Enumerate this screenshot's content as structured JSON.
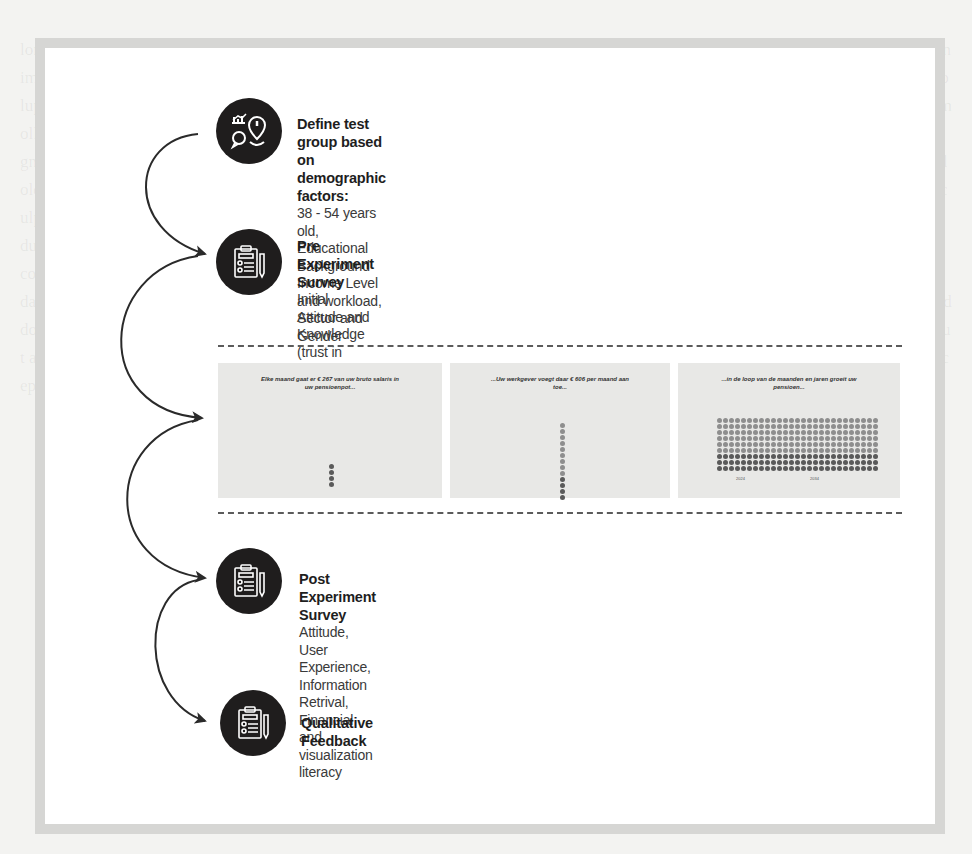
{
  "diagram": {
    "steps": [
      {
        "id": "define-test-group",
        "icon": "analytics-location-icon",
        "title": "Define test group based on demographic factors:",
        "description_lines": [
          "38 - 54 years old, Educational Background",
          "Income Level and workload, Sector and Gender"
        ]
      },
      {
        "id": "pre-experiment-survey",
        "icon": "clipboard-survey-icon",
        "title": "Pre Experiment  Survey",
        "description_lines": [
          "Initial Attitude  and Knowledge (trust in information,",
          "in fund, initial knowledge, domein specific knowledg)"
        ]
      },
      {
        "id": "post-experiment-survey",
        "icon": "clipboard-survey-icon",
        "title": "Post Experiment Survey",
        "description_lines": [
          "Attitude,  User Experience,  Information Retrival,",
          "Financial and visualization literacy"
        ]
      },
      {
        "id": "qualitative-feedback",
        "icon": "clipboard-survey-icon",
        "title": "Qualitative Feedback",
        "description_lines": []
      }
    ],
    "visualization_panels": [
      {
        "caption": "Elke maand gaat er € 267 van uw bruto salaris in uw pensioenpot...",
        "dots": 4,
        "dark_dots": 4
      },
      {
        "caption": "...Uw werkgever voegt daar € 606 per maand aan toe...",
        "dots": 13,
        "dark_dots": 4
      },
      {
        "caption": "...in de loop van de maanden en jaren groeit uw pensioen...",
        "grid_cols": 27,
        "grid_rows": 9,
        "dark_rows": 3,
        "axis_labels": [
          "2024",
          "2034"
        ]
      }
    ],
    "colors": {
      "icon_bg": "#1f1d1d",
      "frame_border": "#d6d6d4",
      "dot_dark": "#5a5a5a",
      "dot_light": "#8e8e8e",
      "arrow": "#2a2a2a"
    }
  }
}
